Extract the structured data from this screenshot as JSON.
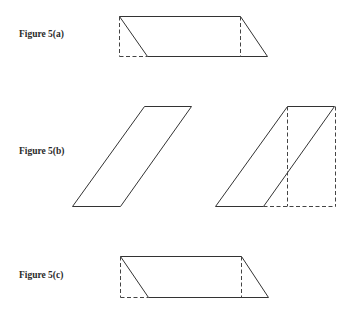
{
  "figures": [
    {
      "id": "5a",
      "label": "Figure 5(a)"
    },
    {
      "id": "5b",
      "label": "Figure 5(b)"
    },
    {
      "id": "5c",
      "label": "Figure 5(c)"
    }
  ],
  "colors": {
    "line": "#333333",
    "dashed": "#444444",
    "background": "#ffffff"
  }
}
